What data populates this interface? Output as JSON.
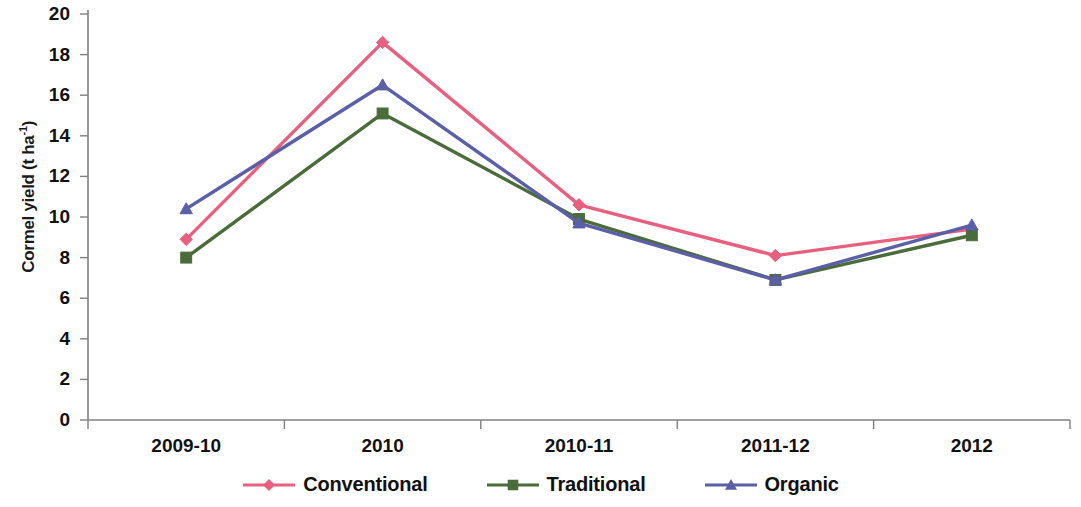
{
  "chart_data": {
    "type": "line",
    "title": "",
    "xlabel": "",
    "ylabel": "Cormel yield (t ha-1)",
    "ylabel_base": "Cormel yield (t ha",
    "ylabel_sup": "-1",
    "ylabel_tail": ")",
    "categories": [
      "2009-10",
      "2010",
      "2010-11",
      "2011-12",
      "2012"
    ],
    "ylim": [
      0,
      20
    ],
    "ytick_step": 2,
    "yticks": [
      "20",
      "18",
      "16",
      "14",
      "12",
      "10",
      "8",
      "6",
      "4",
      "2",
      "0"
    ],
    "ytick_values": [
      20,
      18,
      16,
      14,
      12,
      10,
      8,
      6,
      4,
      2,
      0
    ],
    "grid": "none",
    "legend_position": "bottom-center",
    "series": [
      {
        "name": "Conventional",
        "color": "#e8607f",
        "marker": "diamond",
        "values": [
          8.9,
          18.6,
          10.6,
          8.1,
          9.4
        ]
      },
      {
        "name": "Traditional",
        "color": "#4a6b3a",
        "marker": "square",
        "values": [
          8.0,
          15.1,
          9.9,
          6.9,
          9.1
        ]
      },
      {
        "name": "Organic",
        "color": "#5b5fa8",
        "marker": "triangle",
        "values": [
          10.4,
          16.5,
          9.7,
          6.9,
          9.6
        ]
      }
    ]
  },
  "axes": {
    "axis_color": "#808080",
    "tick_color": "#808080"
  }
}
